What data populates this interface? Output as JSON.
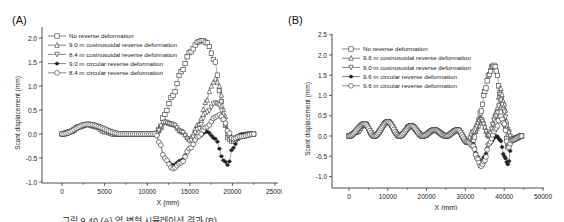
{
  "caption": "그림 9.40 (A) 역 변형 시뮬레이션 결과 (B) ...",
  "chart_data": [
    {
      "type": "line",
      "panel_label": "(A)",
      "title": "",
      "xlabel": "X (mm)",
      "ylabel": "Scant displacement (mm)",
      "xlim": [
        -2500,
        25000
      ],
      "ylim": [
        -1.0,
        2.2
      ],
      "xticks": [
        0,
        5000,
        10000,
        15000,
        20000,
        25000
      ],
      "yticks": [
        -1.0,
        -0.5,
        0.0,
        0.5,
        1.0,
        1.5,
        2.0
      ],
      "grid": false,
      "legend_position": "upper left",
      "series": [
        {
          "name": "No reverse deformation",
          "marker": "square",
          "x": [
            0,
            1000,
            2000,
            3000,
            4000,
            5000,
            6000,
            7000,
            8000,
            9000,
            10000,
            11000,
            11500,
            12000,
            13000,
            14000,
            15000,
            16000,
            16500,
            17000,
            18000,
            18500,
            19000,
            19500,
            20000,
            21000,
            22000,
            22500
          ],
          "y": [
            0,
            0.05,
            0.15,
            0.2,
            0.15,
            0.05,
            0,
            0,
            0,
            0,
            0,
            0,
            0.1,
            0.4,
            0.8,
            1.3,
            1.7,
            1.92,
            1.95,
            1.9,
            1.5,
            0.9,
            0.3,
            -0.1,
            -0.15,
            -0.05,
            0,
            0
          ]
        },
        {
          "name": "9.0 m cosinusoidal reverse deformation",
          "marker": "triangle-up",
          "x": [
            0,
            3000,
            7000,
            11000,
            12000,
            13000,
            14000,
            15000,
            16000,
            17000,
            17500,
            18000,
            18500,
            19000,
            19500,
            20000,
            21000,
            22500
          ],
          "y": [
            0,
            0.2,
            0,
            0,
            0.25,
            0.2,
            0.05,
            -0.1,
            0.2,
            0.7,
            1.0,
            1.15,
            1.0,
            0.5,
            0.05,
            -0.1,
            -0.05,
            0
          ]
        },
        {
          "name": "8.4 m cosinusoidal reverse deformation",
          "marker": "triangle-down",
          "x": [
            0,
            3000,
            7000,
            11000,
            12000,
            13000,
            14000,
            15000,
            16000,
            17000,
            18000,
            18500,
            19000,
            19500,
            20000,
            21000,
            22500
          ],
          "y": [
            0,
            0.2,
            0,
            0,
            0.25,
            0.2,
            0.05,
            -0.15,
            0.1,
            0.45,
            0.65,
            0.6,
            0.3,
            -0.05,
            -0.1,
            -0.05,
            0
          ]
        },
        {
          "name": "9.0 m circular reverse deformation",
          "marker": "star",
          "x": [
            0,
            3000,
            7000,
            11000,
            11500,
            12000,
            13000,
            14000,
            15000,
            16000,
            17000,
            18000,
            19000,
            19500,
            20000,
            21000,
            22500
          ],
          "y": [
            0,
            0.2,
            0,
            0,
            -0.2,
            -0.5,
            -0.65,
            -0.55,
            -0.3,
            -0.05,
            0.05,
            -0.1,
            -0.55,
            -0.65,
            -0.3,
            0,
            0
          ]
        },
        {
          "name": "8.4 m circular reverse deformation",
          "marker": "circle",
          "x": [
            0,
            3000,
            7000,
            11000,
            11500,
            12000,
            13000,
            14000,
            15000,
            16000,
            17000,
            18000,
            18500,
            19000,
            19500,
            20000,
            21000,
            22500
          ],
          "y": [
            0,
            0.2,
            0,
            0,
            -0.2,
            -0.5,
            -0.72,
            -0.6,
            -0.3,
            -0.05,
            0.15,
            0.35,
            0.4,
            0.3,
            0.05,
            -0.1,
            -0.05,
            0
          ]
        }
      ]
    },
    {
      "type": "line",
      "panel_label": "(B)",
      "title": "",
      "xlabel": "X (mm)",
      "ylabel": "Scant displacement (mm)",
      "xlim": [
        -4000,
        50000
      ],
      "ylim": [
        -1.3,
        2.5
      ],
      "xticks": [
        0,
        10000,
        20000,
        30000,
        40000,
        50000
      ],
      "yticks": [
        -1.0,
        -0.5,
        0.0,
        0.5,
        1.0,
        1.5,
        2.0,
        2.5
      ],
      "grid": false,
      "legend_position": "upper left",
      "series": [
        {
          "name": "No reverse deformation",
          "marker": "square",
          "x": [
            0,
            2000,
            4000,
            6500,
            10000,
            13000,
            16000,
            19000,
            22000,
            25000,
            28000,
            30500,
            32000,
            33000,
            34000,
            35000,
            36000,
            37000,
            37500,
            38000,
            39000,
            40000,
            41000,
            42000,
            43000,
            44500
          ],
          "y": [
            0,
            0.1,
            0.3,
            0,
            0.35,
            0,
            0.25,
            0,
            0.15,
            0,
            0.15,
            -0.15,
            -0.1,
            0.2,
            0.6,
            1.1,
            1.5,
            1.72,
            1.75,
            1.6,
            1.0,
            0.3,
            -0.2,
            -0.1,
            -0.05,
            0
          ]
        },
        {
          "name": "9.6 m cosinusoidal reverse deformation",
          "marker": "triangle-up",
          "x": [
            0,
            4000,
            6500,
            10000,
            13000,
            16000,
            19000,
            22000,
            25000,
            28000,
            30500,
            32000,
            34000,
            36000,
            38000,
            39000,
            40000,
            41000,
            42000,
            44500
          ],
          "y": [
            0,
            0.3,
            0,
            0.35,
            0,
            0.25,
            0,
            0.15,
            0,
            0.15,
            -0.15,
            0.1,
            0.45,
            0.0,
            0.6,
            1.2,
            0.8,
            0.2,
            -0.1,
            0
          ]
        },
        {
          "name": "9.0 m cosinusoidal reverse deformation",
          "marker": "triangle-down",
          "x": [
            0,
            4000,
            6500,
            10000,
            13000,
            16000,
            19000,
            22000,
            25000,
            28000,
            30500,
            32000,
            34000,
            36000,
            38000,
            39000,
            40000,
            41000,
            42000,
            44500
          ],
          "y": [
            0,
            0.3,
            0,
            0.35,
            0,
            0.25,
            0,
            0.15,
            0,
            0.15,
            -0.15,
            0.1,
            0.4,
            0.0,
            0.5,
            0.9,
            0.6,
            0.1,
            -0.1,
            0
          ]
        },
        {
          "name": "9.6 m circular reverse deformation",
          "marker": "star",
          "x": [
            0,
            4000,
            6500,
            10000,
            13000,
            16000,
            19000,
            22000,
            25000,
            28000,
            30500,
            32000,
            33000,
            34000,
            35000,
            36000,
            38000,
            39000,
            40000,
            41000,
            42000,
            44500
          ],
          "y": [
            0,
            0.3,
            0,
            0.35,
            0,
            0.25,
            0,
            0.15,
            0,
            0.15,
            -0.15,
            -0.2,
            -0.5,
            -0.65,
            -0.5,
            -0.2,
            0,
            -0.1,
            -0.5,
            -0.7,
            -0.1,
            0
          ]
        },
        {
          "name": "9.6 m circular reverse deformation",
          "marker": "circle",
          "x": [
            0,
            4000,
            6500,
            10000,
            13000,
            16000,
            19000,
            22000,
            25000,
            28000,
            30500,
            32000,
            33000,
            34000,
            35000,
            36000,
            38000,
            39000,
            40000,
            41000,
            42000,
            44500
          ],
          "y": [
            0,
            0.3,
            0,
            0.35,
            0,
            0.25,
            0,
            0.15,
            0,
            0.15,
            -0.15,
            -0.25,
            -0.55,
            -0.75,
            -0.6,
            -0.2,
            0.2,
            0.5,
            0.3,
            -0.3,
            -0.1,
            0
          ]
        }
      ]
    }
  ]
}
